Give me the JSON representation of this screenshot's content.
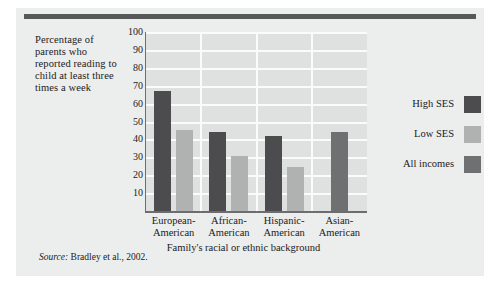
{
  "figure": {
    "y_axis_caption": "Percentage of parents who reported reading to child at least three times a week",
    "source_label": "Source:",
    "source_text": "Bradley et al., 2002."
  },
  "colors": {
    "high_ses": "#4c4c4e",
    "low_ses": "#b0b1b1",
    "all_incomes": "#6f7071",
    "plot_background": "#dfe0e0",
    "gridline": "#fbfbfb",
    "card_background": "#eceded",
    "rule": "#58585a",
    "text": "#1b1b1b"
  },
  "chart_data": {
    "type": "bar",
    "title": "",
    "subtitle": "",
    "xlabel": "Family's racial or ethnic background",
    "ylabel": "Percentage of parents who reported reading to child at least three times a week",
    "categories": [
      "European-American",
      "African-American",
      "Hispanic-American",
      "Asian-American"
    ],
    "category_lines": [
      [
        "European-",
        "American"
      ],
      [
        "African-",
        "American"
      ],
      [
        "Hispanic-",
        "American"
      ],
      [
        "Asian-",
        "American"
      ]
    ],
    "series": [
      {
        "name": "High SES",
        "color": "#4c4c4e",
        "values": [
          67,
          44,
          42,
          null
        ]
      },
      {
        "name": "Low SES",
        "color": "#b0b1b1",
        "values": [
          45,
          31,
          24.5,
          null
        ]
      },
      {
        "name": "All incomes",
        "color": "#6f7071",
        "values": [
          null,
          null,
          null,
          44
        ]
      }
    ],
    "ylim": [
      0,
      100
    ],
    "ytick_labels": [
      "100",
      "90",
      "80",
      "70",
      "60",
      "50",
      "40",
      "30",
      "20",
      "10"
    ],
    "ytick_values": [
      100,
      90,
      80,
      70,
      60,
      50,
      40,
      30,
      20,
      10
    ],
    "grid": true,
    "grid_axis": "y",
    "legend_position": "right",
    "legend": [
      "High SES",
      "Low SES",
      "All incomes"
    ]
  }
}
